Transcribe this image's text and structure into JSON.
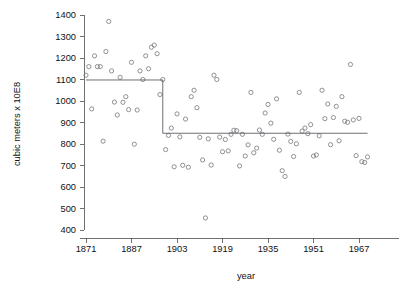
{
  "chart_data": {
    "type": "scatter",
    "title": "",
    "xlabel": "year",
    "ylabel": "cubic meters x 10E8",
    "xlim": [
      1869,
      1981
    ],
    "ylim": [
      400,
      1400
    ],
    "grid": false,
    "legend": null,
    "x_ticks": [
      1871,
      1887,
      1903,
      1919,
      1935,
      1951,
      1967
    ],
    "y_ticks": [
      400,
      500,
      600,
      700,
      800,
      900,
      1000,
      1100,
      1200,
      1300,
      1400
    ],
    "series": [
      {
        "name": "Nile annual flow",
        "marker": "open-circle",
        "color": "#6f6f76",
        "x": [
          1871,
          1872,
          1873,
          1874,
          1875,
          1876,
          1877,
          1878,
          1879,
          1880,
          1881,
          1882,
          1883,
          1884,
          1885,
          1886,
          1887,
          1888,
          1889,
          1890,
          1891,
          1892,
          1893,
          1894,
          1895,
          1896,
          1897,
          1898,
          1899,
          1900,
          1901,
          1902,
          1903,
          1904,
          1905,
          1906,
          1907,
          1908,
          1909,
          1910,
          1911,
          1912,
          1913,
          1914,
          1915,
          1916,
          1917,
          1918,
          1919,
          1920,
          1921,
          1922,
          1923,
          1924,
          1925,
          1926,
          1927,
          1928,
          1929,
          1930,
          1931,
          1932,
          1933,
          1934,
          1935,
          1936,
          1937,
          1938,
          1939,
          1940,
          1941,
          1942,
          1943,
          1944,
          1945,
          1946,
          1947,
          1948,
          1949,
          1950,
          1951,
          1952,
          1953,
          1954,
          1955,
          1956,
          1957,
          1958,
          1959,
          1960,
          1961,
          1962,
          1963,
          1964,
          1965,
          1966,
          1967,
          1968,
          1969,
          1970
        ],
        "y": [
          1120,
          1160,
          963,
          1210,
          1160,
          1160,
          813,
          1230,
          1370,
          1140,
          995,
          935,
          1110,
          994,
          1020,
          960,
          1180,
          799,
          958,
          1140,
          1100,
          1210,
          1150,
          1250,
          1260,
          1220,
          1030,
          1100,
          774,
          840,
          874,
          694,
          940,
          833,
          701,
          916,
          692,
          1020,
          1050,
          969,
          831,
          726,
          456,
          824,
          702,
          1120,
          1100,
          832,
          764,
          821,
          768,
          845,
          864,
          862,
          698,
          845,
          744,
          796,
          1040,
          759,
          781,
          865,
          845,
          944,
          984,
          897,
          822,
          1010,
          771,
          676,
          649,
          846,
          812,
          742,
          801,
          1040,
          860,
          874,
          848,
          890,
          744,
          749,
          838,
          1050,
          918,
          986,
          797,
          923,
          975,
          815,
          1020,
          906,
          901,
          1170,
          912,
          746,
          919,
          718,
          714,
          740
        ]
      }
    ],
    "fit": {
      "name": "changepoint step fit",
      "color": "#55555c",
      "changepoint_year": 1898,
      "segments": [
        {
          "x_start": 1871,
          "x_end": 1898,
          "level": 1097.75
        },
        {
          "x_start": 1898,
          "x_end": 1970,
          "level": 849.97
        }
      ]
    }
  }
}
